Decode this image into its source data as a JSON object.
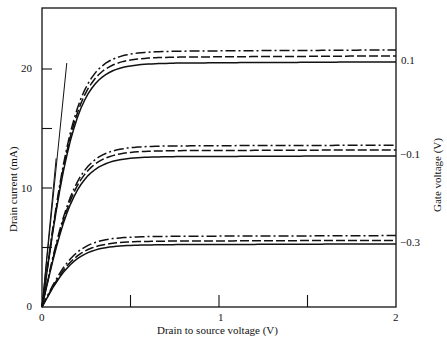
{
  "chart_data": {
    "type": "line",
    "title": "",
    "xlabel": "Drain to source voltage (V)",
    "ylabel": "Drain current (mA)",
    "y2label": "Gate voltage (V)",
    "xlim": [
      0,
      2
    ],
    "ylim": [
      0,
      25
    ],
    "x_ticks_labeled": [
      "0",
      "1",
      "2"
    ],
    "x_ticks": [
      0,
      0.5,
      1,
      1.5,
      2
    ],
    "y_ticks_labeled": [
      "0",
      "10",
      "20"
    ],
    "y_ticks": [
      0,
      5,
      10,
      15,
      20
    ],
    "grid": false,
    "line_styles": [
      "solid",
      "dashed",
      "dash-dot"
    ],
    "groups": [
      {
        "gate_voltage": "0.1",
        "series": [
          {
            "style": "solid",
            "x": [
              0,
              0.1,
              0.2,
              0.3,
              0.5,
              1,
              2
            ],
            "values": [
              0,
              10.5,
              17.5,
              19.8,
              20.4,
              20.5,
              20.6
            ]
          },
          {
            "style": "dashed",
            "x": [
              0,
              0.1,
              0.2,
              0.3,
              0.5,
              1,
              2
            ],
            "values": [
              0,
              10.6,
              17.8,
              20.2,
              20.8,
              21.0,
              21.1
            ]
          },
          {
            "style": "dash-dot",
            "x": [
              0,
              0.1,
              0.2,
              0.3,
              0.5,
              1,
              2
            ],
            "values": [
              0,
              10.7,
              18.1,
              20.6,
              21.2,
              21.4,
              21.6
            ]
          }
        ]
      },
      {
        "gate_voltage": "-0.1",
        "series": [
          {
            "style": "solid",
            "x": [
              0,
              0.1,
              0.2,
              0.3,
              0.5,
              1,
              2
            ],
            "values": [
              0,
              6.5,
              10.8,
              12.2,
              12.6,
              12.7,
              12.7
            ]
          },
          {
            "style": "dashed",
            "x": [
              0,
              0.1,
              0.2,
              0.3,
              0.5,
              1,
              2
            ],
            "values": [
              0,
              6.6,
              11.0,
              12.6,
              13.0,
              13.1,
              13.2
            ]
          },
          {
            "style": "dash-dot",
            "x": [
              0,
              0.1,
              0.2,
              0.3,
              0.5,
              1,
              2
            ],
            "values": [
              0,
              6.7,
              11.3,
              12.9,
              13.3,
              13.5,
              13.6
            ]
          }
        ]
      },
      {
        "gate_voltage": "-0.3",
        "series": [
          {
            "style": "solid",
            "x": [
              0,
              0.1,
              0.2,
              0.3,
              0.5,
              1,
              2
            ],
            "values": [
              0,
              2.8,
              4.5,
              5.0,
              5.2,
              5.3,
              5.3
            ]
          },
          {
            "style": "dashed",
            "x": [
              0,
              0.1,
              0.2,
              0.3,
              0.5,
              1,
              2
            ],
            "values": [
              0,
              2.8,
              4.6,
              5.2,
              5.5,
              5.6,
              5.6
            ]
          },
          {
            "style": "dash-dot",
            "x": [
              0,
              0.1,
              0.2,
              0.3,
              0.5,
              1,
              2
            ],
            "values": [
              0,
              2.9,
              4.7,
              5.4,
              5.8,
              5.9,
              6.0
            ]
          }
        ]
      }
    ],
    "annotations": [
      "Two straight reference lines from origin (load lines) reaching the top curves"
    ]
  },
  "labels": {
    "x0": "0",
    "x1": "1",
    "x2": "2",
    "y0": "0",
    "y10": "10",
    "y20": "20",
    "g1": "0.1",
    "g2": "−0.1",
    "g3": "−0.3",
    "xlabel": "Drain to source voltage (V)",
    "ylabel": "Drain current (mA)",
    "y2label": "Gate voltage (V)"
  }
}
